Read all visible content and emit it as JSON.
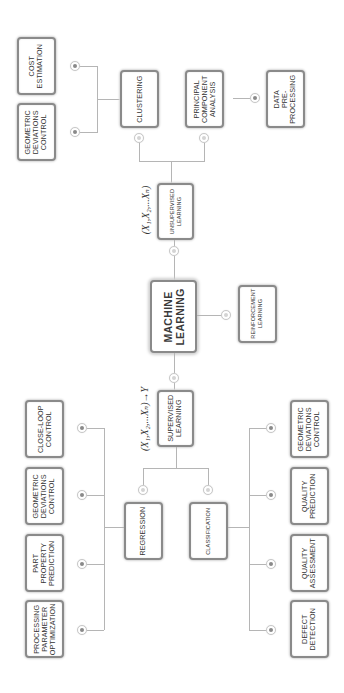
{
  "diagram": {
    "orientation": "rotated-90-ccw",
    "root": {
      "label": "MACHINE\nLEARNING"
    },
    "branches": {
      "unsupervised": {
        "label": "UNSUPERVISED\nLEARNING",
        "formula": "(X₁,X₂,...Xₙ)",
        "methods": [
          {
            "label": "CLUSTERING",
            "applications": [
              {
                "label": "COST\nESTIMATION"
              },
              {
                "label": "GEOMETRIC\nDEVIATIONS\nCONTROL"
              }
            ]
          },
          {
            "label": "PRINCIPAL\nCOMPONENT\nANALYSIS",
            "applications": [
              {
                "label": "DATA\nPRE-\nPROCESSING"
              }
            ]
          }
        ]
      },
      "reinforcement": {
        "label": "REINFORCEMENT\nLEARNING"
      },
      "supervised": {
        "label": "SUPERVISED\nLEARNING",
        "formula": "(X₁,X₂,...Xₙ)→Y",
        "methods": [
          {
            "label": "REGRESSION",
            "applications": [
              {
                "label": "CLOSE-LOOP\nCONTROL"
              },
              {
                "label": "GEOMETRIC\nDEVIATIONS\nCONTROL"
              },
              {
                "label": "PART\nPROPERTY\nPREDICTION"
              },
              {
                "label": "PROCESSING\nPARAMETER\nOPTIMIZATION"
              }
            ]
          },
          {
            "label": "CLASSIFICATION",
            "applications": [
              {
                "label": "GEOMETRIC\nDEVIATIONS\nCONTROL"
              },
              {
                "label": "QUALITY\nPREDICTION"
              },
              {
                "label": "QUALITY\nASSESSMENT"
              },
              {
                "label": "DEFECT\nDETECTION"
              }
            ]
          }
        ]
      }
    },
    "colors": {
      "border": "#8a8a8a",
      "connector": "#b5b5b5",
      "text": "#333333",
      "background": "#ffffff"
    }
  }
}
